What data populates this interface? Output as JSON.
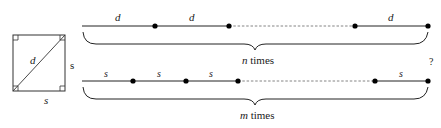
{
  "square": {
    "diagonal_label": "d",
    "side_right_label": "s",
    "side_bottom_label": "s"
  },
  "top_row": {
    "segment_labels": [
      "d",
      "d",
      "d"
    ],
    "brace_label_var": "n",
    "brace_label_text": " times"
  },
  "bottom_row": {
    "segment_labels": [
      "s",
      "s",
      "s",
      "s"
    ],
    "brace_label_var": "m",
    "brace_label_text": " times"
  },
  "question_mark": "?",
  "colors": {
    "line": "#222222",
    "dashed": "#777777",
    "dot": "#000000"
  }
}
